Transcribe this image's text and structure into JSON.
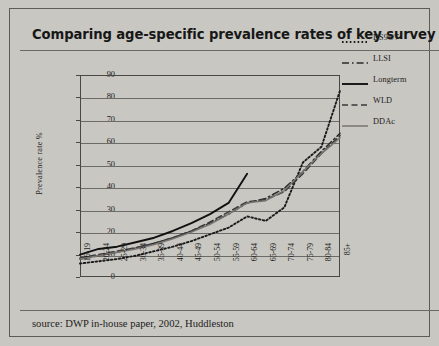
{
  "title": "Comparing age-specific prevalence rates of key survey estimates",
  "source": "source: DWP in-house paper, 2002, Huddleston",
  "legend": {
    "items": [
      {
        "label": "DS96/7",
        "style": "dotted"
      },
      {
        "label": "LLSI",
        "style": "dash-dot"
      },
      {
        "label": "Longterm",
        "style": "solid-thick"
      },
      {
        "label": "WLD",
        "style": "dashed"
      },
      {
        "label": "DDAc",
        "style": "solid-thin"
      }
    ]
  },
  "chart_data": {
    "type": "line",
    "title": "Comparing age-specific prevalence rates of key survey estimates",
    "xlabel": "",
    "ylabel": "Prevalence rate %",
    "ylim": [
      0,
      90
    ],
    "ytick_step": 10,
    "yticks": [
      0,
      10,
      20,
      30,
      40,
      50,
      60,
      70,
      80,
      90
    ],
    "grid": true,
    "legend_position": "right",
    "categories": [
      "16-19",
      "20-24",
      "25-29",
      "30-34",
      "35-39",
      "40-44",
      "45-49",
      "50-54",
      "55-59",
      "60-64",
      "65-69",
      "70-74",
      "75-79",
      "80-84",
      "85+"
    ],
    "series": [
      {
        "name": "DS96/7",
        "style": "dotted",
        "color": "#1a1a1a",
        "values": [
          6,
          7,
          8,
          9.5,
          11.5,
          13.5,
          16,
          19,
          22,
          27,
          25,
          31,
          51,
          58,
          83
        ]
      },
      {
        "name": "LLSI",
        "style": "dash-dot",
        "color": "#2b2b2b",
        "values": [
          8,
          9.5,
          11,
          13,
          15,
          17.5,
          20.5,
          24,
          28,
          33,
          35,
          39.5,
          47,
          56,
          64
        ]
      },
      {
        "name": "Longterm",
        "style": "solid-thick",
        "color": "#111111",
        "values": [
          10,
          12.5,
          13.5,
          15.5,
          17.5,
          20.5,
          24,
          28,
          33,
          46,
          null,
          null,
          null,
          null,
          null
        ]
      },
      {
        "name": "WLD",
        "style": "dashed",
        "color": "#3a3a3a",
        "values": [
          8.5,
          10,
          11.5,
          13,
          15,
          17.5,
          20.5,
          24.5,
          29,
          33.5,
          34.5,
          38,
          46,
          55,
          63
        ]
      },
      {
        "name": "DDAc",
        "style": "solid-thin",
        "color": "#777470",
        "values": [
          8,
          9.5,
          11,
          12.5,
          14.5,
          17,
          20,
          23.5,
          28,
          33,
          34,
          38.5,
          47,
          55,
          62
        ]
      }
    ]
  }
}
